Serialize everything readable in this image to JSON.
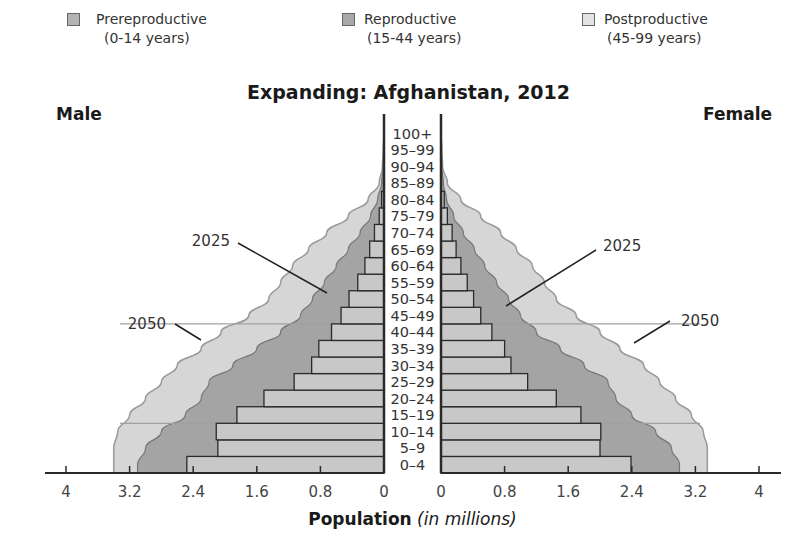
{
  "legend": [
    {
      "label": "Prereproductive",
      "sub": "(0-14 years)",
      "color": "#b4b4b4"
    },
    {
      "label": "Reproductive",
      "sub": "(15-44 years)",
      "color": "#a9a9a9"
    },
    {
      "label": "Postproductive",
      "sub": "(45-99 years)",
      "color": "#dcdcdc"
    }
  ],
  "labels": {
    "male": "Male",
    "female": "Female",
    "title": "Expanding: Afghanistan, 2012",
    "xlabel_main": "Population",
    "xlabel_unit": "(in millions)",
    "projection_2025": "2025",
    "projection_2050": "2050"
  },
  "colors": {
    "bar_fill": "#c8c8c8",
    "bar_stroke": "#2a2a2a",
    "area_2025": "#a4a4a4",
    "area_2050": "#d6d6d6",
    "area_2050_stroke": "#9a9a9a",
    "area_2025_stroke": "#777777"
  },
  "chart_data": {
    "type": "bar",
    "subtype": "population-pyramid",
    "title": "Expanding: Afghanistan, 2012",
    "xlabel": "Population (in millions)",
    "ylabel": "",
    "left_label": "Male",
    "right_label": "Female",
    "categories": [
      "0–4",
      "5–9",
      "10–14",
      "15–19",
      "20–24",
      "25–29",
      "30–34",
      "35–39",
      "40–44",
      "45–49",
      "50–54",
      "55–59",
      "60–64",
      "65–69",
      "70–74",
      "75–79",
      "80–84",
      "85–89",
      "90–94",
      "95–99",
      "100+"
    ],
    "series": [
      {
        "name": "Male 2012",
        "values": [
          2.48,
          2.09,
          2.11,
          1.85,
          1.51,
          1.13,
          0.91,
          0.82,
          0.66,
          0.54,
          0.44,
          0.33,
          0.24,
          0.18,
          0.12,
          0.06,
          0.03,
          0.0,
          0.0,
          0.0,
          0.0
        ]
      },
      {
        "name": "Female 2012",
        "values": [
          2.39,
          2.0,
          2.01,
          1.76,
          1.45,
          1.09,
          0.88,
          0.8,
          0.64,
          0.5,
          0.41,
          0.33,
          0.25,
          0.19,
          0.14,
          0.08,
          0.04,
          0.0,
          0.0,
          0.0,
          0.0
        ]
      },
      {
        "name": "Male 2025 (projected)",
        "values": [
          3.1,
          3.0,
          2.8,
          2.5,
          2.3,
          2.2,
          1.9,
          1.6,
          1.3,
          1.05,
          0.9,
          0.75,
          0.6,
          0.45,
          0.3,
          0.17,
          0.08,
          0.03,
          0.01,
          0.0,
          0.0
        ]
      },
      {
        "name": "Female 2025 (projected)",
        "values": [
          3.0,
          2.9,
          2.7,
          2.4,
          2.2,
          2.1,
          1.8,
          1.5,
          1.2,
          1.0,
          0.85,
          0.7,
          0.55,
          0.42,
          0.28,
          0.16,
          0.07,
          0.03,
          0.01,
          0.0,
          0.0
        ]
      },
      {
        "name": "Male 2050 (projected)",
        "values": [
          3.4,
          3.4,
          3.35,
          3.2,
          3.0,
          2.8,
          2.6,
          2.3,
          2.05,
          1.7,
          1.45,
          1.3,
          1.15,
          0.95,
          0.72,
          0.45,
          0.2,
          0.06,
          0.02,
          0.01,
          0.0
        ]
      },
      {
        "name": "Female 2050 (projected)",
        "values": [
          3.35,
          3.35,
          3.3,
          3.15,
          2.95,
          2.75,
          2.55,
          2.25,
          2.0,
          1.7,
          1.45,
          1.3,
          1.15,
          0.95,
          0.75,
          0.5,
          0.25,
          0.08,
          0.02,
          0.01,
          0.0
        ]
      }
    ],
    "age_groups": {
      "Prereproductive": "0-14 years",
      "Reproductive": "15-44 years",
      "Postproductive": "45-99 years"
    },
    "x_ticks_left": [
      "4",
      "3.2",
      "2.4",
      "1.6",
      "0.8",
      "0"
    ],
    "x_ticks_right": [
      "0",
      "0.8",
      "1.6",
      "2.4",
      "3.2",
      "4"
    ],
    "xlim": [
      0,
      4
    ],
    "annotations": [
      "2025",
      "2050"
    ],
    "legend_position": "top",
    "grid": false
  }
}
